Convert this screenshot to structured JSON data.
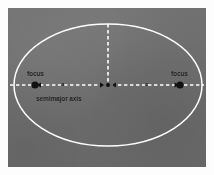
{
  "figure": {
    "kind": "ellipse-orbit-geometry-diagram",
    "panel_background_color": "#6e6e6e",
    "page_background_color": "#ffffff",
    "stroke_color": "#ffffff",
    "marker_color": "#121212",
    "label_color": "#17181a"
  },
  "labels": {
    "focus_left": "focus",
    "focus_right": "focus",
    "semimajor_axis": "semimajor axis",
    "segment_a": "a",
    "segment_c": "c"
  },
  "geometry": {
    "center_x": 100,
    "center_y": 77,
    "semimajor_px": 94,
    "semiminor_px": 61,
    "focus_left_x": 27,
    "focus_right_x": 172,
    "ellipse_top_y": 16,
    "ellipse_bottom_y": 138,
    "major_axis_left_x": 2,
    "major_axis_right_x": 196
  },
  "elements": {
    "ellipse": "ellipse-outline",
    "major_axis": "horizontal-dashed-major-axis",
    "semiminor_line": "vertical-dashed-semiminor-axis",
    "focus_dot_left": "focus-marker",
    "focus_dot_right": "focus-marker",
    "center_dot": "ellipse-center-marker",
    "arrow_markers": "dimension-arrow-ticks"
  }
}
